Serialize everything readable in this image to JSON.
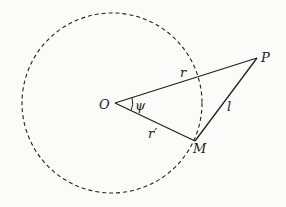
{
  "diagram": {
    "labels": {
      "O": "O",
      "P": "P",
      "M": "M",
      "r": "r",
      "r_prime": "r′",
      "l": "l",
      "psi": "ψ"
    },
    "colors": {
      "line": "#222222",
      "background": "#fbfbf9"
    }
  }
}
